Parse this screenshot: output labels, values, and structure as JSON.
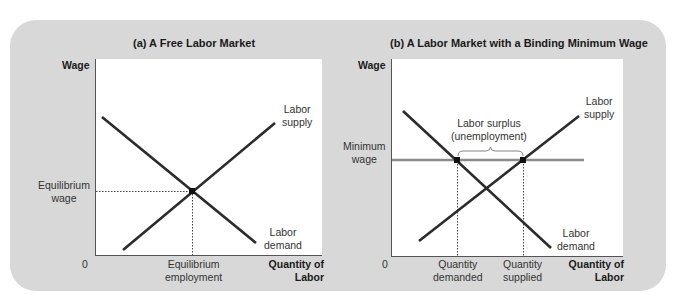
{
  "panel_a": {
    "title": "(a) A Free Labor Market",
    "y_axis_label": "Wage",
    "x_axis_label_line1": "Quantity of",
    "x_axis_label_line2": "Labor",
    "origin_label": "0",
    "supply_label_line1": "Labor",
    "supply_label_line2": "supply",
    "demand_label_line1": "Labor",
    "demand_label_line2": "demand",
    "eq_wage_line1": "Equilibrium",
    "eq_wage_line2": "wage",
    "eq_employment_line1": "Equilibrium",
    "eq_employment_line2": "employment"
  },
  "panel_b": {
    "title": "(b) A Labor Market with a Binding Minimum Wage",
    "y_axis_label": "Wage",
    "x_axis_label_line1": "Quantity of",
    "x_axis_label_line2": "Labor",
    "origin_label": "0",
    "supply_label_line1": "Labor",
    "supply_label_line2": "supply",
    "demand_label_line1": "Labor",
    "demand_label_line2": "demand",
    "min_wage_line1": "Minimum",
    "min_wage_line2": "wage",
    "surplus_line1": "Labor surplus",
    "surplus_line2": "(unemployment)",
    "qd_line1": "Quantity",
    "qd_line2": "demanded",
    "qs_line1": "Quantity",
    "qs_line2": "supplied"
  },
  "colors": {
    "panel_bg": "#d8d8d8",
    "curve": "#2b2b2b",
    "min_wage_line": "#8c8c8c",
    "plot_bg": "#ffffff"
  }
}
